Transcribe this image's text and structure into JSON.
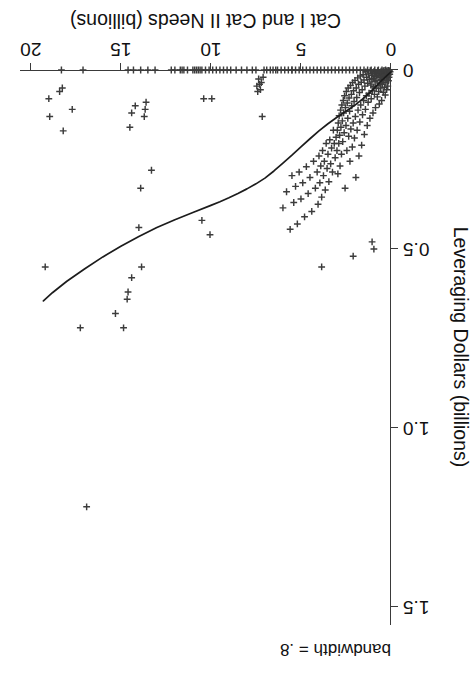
{
  "chart_data": {
    "type": "scatter",
    "title": "",
    "xlabel": "Cat I and Cat II Needs (billions)",
    "ylabel": "Leveraging Dollars (billions)",
    "xlim": [
      0,
      20.6
    ],
    "ylim": [
      0,
      1.55
    ],
    "xticks": [
      0,
      5,
      10,
      15,
      20
    ],
    "xticklabels": [
      "0",
      "5",
      "10",
      "15",
      "20"
    ],
    "yticks": [
      0,
      0.5,
      1.0,
      1.5
    ],
    "yticklabels": [
      "0",
      "0.5",
      "1.0",
      "1.5"
    ],
    "grid": false,
    "legend": false,
    "annotation": "bandwidth = .8",
    "marker_style": "plus",
    "marker_color": "#3c3c3c",
    "line_color": "#1c1c1c",
    "series": [
      {
        "name": "observations",
        "marker": "plus",
        "points": [
          [
            0.05,
            0.005
          ],
          [
            0.07,
            0.012
          ],
          [
            0.09,
            0.002
          ],
          [
            0.11,
            0.02
          ],
          [
            0.12,
            0.008
          ],
          [
            0.14,
            0.03
          ],
          [
            0.15,
            0.001
          ],
          [
            0.16,
            0.015
          ],
          [
            0.18,
            0.045
          ],
          [
            0.19,
            0.006
          ],
          [
            0.21,
            0.025
          ],
          [
            0.22,
            0.002
          ],
          [
            0.24,
            0.055
          ],
          [
            0.25,
            0.018
          ],
          [
            0.27,
            0.004
          ],
          [
            0.28,
            0.035
          ],
          [
            0.3,
            0.011
          ],
          [
            0.32,
            0.07
          ],
          [
            0.33,
            0.001
          ],
          [
            0.35,
            0.022
          ],
          [
            0.36,
            0.048
          ],
          [
            0.38,
            0.009
          ],
          [
            0.4,
            0.03
          ],
          [
            0.41,
            0.002
          ],
          [
            0.43,
            0.062
          ],
          [
            0.45,
            0.017
          ],
          [
            0.47,
            0.005
          ],
          [
            0.48,
            0.04
          ],
          [
            0.5,
            0.013
          ],
          [
            0.52,
            0.085
          ],
          [
            0.54,
            0.027
          ],
          [
            0.55,
            0.003
          ],
          [
            0.57,
            0.05
          ],
          [
            0.59,
            0.016
          ],
          [
            0.61,
            0.038
          ],
          [
            0.63,
            0.007
          ],
          [
            0.65,
            0.095
          ],
          [
            0.66,
            0.021
          ],
          [
            0.68,
            0.06
          ],
          [
            0.7,
            0.011
          ],
          [
            0.72,
            0.043
          ],
          [
            0.74,
            0.002
          ],
          [
            0.76,
            0.075
          ],
          [
            0.78,
            0.029
          ],
          [
            0.8,
            0.014
          ],
          [
            0.82,
            0.052
          ],
          [
            0.84,
            0.008
          ],
          [
            0.86,
            0.105
          ],
          [
            0.88,
            0.033
          ],
          [
            0.9,
            0.019
          ],
          [
            0.92,
            0.068
          ],
          [
            0.94,
            0.004
          ],
          [
            0.96,
            0.047
          ],
          [
            0.98,
            0.024
          ],
          [
            1.0,
            0.12
          ],
          [
            1.02,
            0.009
          ],
          [
            1.04,
            0.058
          ],
          [
            1.06,
            0.031
          ],
          [
            1.08,
            0.015
          ],
          [
            1.1,
            0.08
          ],
          [
            1.12,
            0.042
          ],
          [
            1.15,
            0.002
          ],
          [
            1.17,
            0.135
          ],
          [
            1.2,
            0.026
          ],
          [
            1.22,
            0.065
          ],
          [
            1.25,
            0.011
          ],
          [
            1.27,
            0.09
          ],
          [
            1.3,
            0.037
          ],
          [
            1.32,
            0.155
          ],
          [
            1.35,
            0.02
          ],
          [
            1.37,
            0.072
          ],
          [
            1.4,
            0.005
          ],
          [
            1.42,
            0.11
          ],
          [
            1.45,
            0.045
          ],
          [
            1.48,
            0.18
          ],
          [
            1.5,
            0.028
          ],
          [
            1.52,
            0.085
          ],
          [
            1.55,
            0.013
          ],
          [
            1.58,
            0.125
          ],
          [
            1.6,
            0.055
          ],
          [
            1.63,
            0.21
          ],
          [
            1.65,
            0.034
          ],
          [
            1.68,
            0.098
          ],
          [
            1.7,
            0.017
          ],
          [
            1.73,
            0.145
          ],
          [
            1.75,
            0.063
          ],
          [
            1.78,
            0.24
          ],
          [
            1.8,
            0.04
          ],
          [
            1.83,
            0.112
          ],
          [
            1.85,
            0.022
          ],
          [
            1.88,
            0.168
          ],
          [
            1.9,
            0.077
          ],
          [
            1.93,
            0.05
          ],
          [
            1.95,
            0.3
          ],
          [
            1.98,
            0.13
          ],
          [
            2.0,
            0.029
          ],
          [
            2.03,
            0.19
          ],
          [
            2.05,
            0.088
          ],
          [
            2.08,
            0.058
          ],
          [
            2.1,
            0.148
          ],
          [
            2.13,
            0.035
          ],
          [
            2.15,
            0.215
          ],
          [
            2.18,
            0.1
          ],
          [
            2.2,
            0.068
          ],
          [
            2.23,
            0.165
          ],
          [
            2.25,
            0.043
          ],
          [
            2.28,
            0.255
          ],
          [
            2.3,
            0.115
          ],
          [
            2.33,
            0.078
          ],
          [
            2.35,
            0.185
          ],
          [
            2.38,
            0.05
          ],
          [
            2.4,
            0.135
          ],
          [
            2.43,
            0.092
          ],
          [
            2.45,
            0.225
          ],
          [
            2.48,
            0.06
          ],
          [
            2.5,
            0.155
          ],
          [
            2.53,
            0.105
          ],
          [
            2.55,
            0.33
          ],
          [
            2.58,
            0.072
          ],
          [
            2.6,
            0.175
          ],
          [
            2.63,
            0.12
          ],
          [
            2.65,
            0.085
          ],
          [
            2.68,
            0.2
          ],
          [
            2.7,
            0.142
          ],
          [
            2.73,
            0.098
          ],
          [
            2.75,
            0.235
          ],
          [
            2.78,
            0.16
          ],
          [
            2.8,
            0.112
          ],
          [
            2.83,
            0.268
          ],
          [
            2.85,
            0.182
          ],
          [
            2.88,
            0.128
          ],
          [
            2.9,
            0.205
          ],
          [
            2.93,
            0.148
          ],
          [
            2.95,
            0.29
          ],
          [
            2.98,
            0.168
          ],
          [
            3.0,
            0.225
          ],
          [
            3.05,
            0.188
          ],
          [
            3.1,
            0.245
          ],
          [
            3.15,
            0.205
          ],
          [
            3.2,
            0.168
          ],
          [
            3.25,
            0.285
          ],
          [
            3.3,
            0.218
          ],
          [
            3.35,
            0.262
          ],
          [
            3.4,
            0.195
          ],
          [
            3.45,
            0.312
          ],
          [
            3.5,
            0.235
          ],
          [
            3.55,
            0.275
          ],
          [
            3.6,
            0.205
          ],
          [
            3.65,
            0.335
          ],
          [
            3.7,
            0.255
          ],
          [
            3.75,
            0.295
          ],
          [
            3.8,
            0.225
          ],
          [
            3.85,
            0.355
          ],
          [
            3.9,
            0.268
          ],
          [
            3.95,
            0.315
          ],
          [
            4.0,
            0.24
          ],
          [
            4.05,
            0.375
          ],
          [
            4.1,
            0.285
          ],
          [
            4.2,
            0.33
          ],
          [
            4.3,
            0.255
          ],
          [
            4.4,
            0.395
          ],
          [
            4.5,
            0.3
          ],
          [
            4.6,
            0.345
          ],
          [
            4.7,
            0.27
          ],
          [
            4.8,
            0.41
          ],
          [
            4.9,
            0.315
          ],
          [
            5.0,
            0.36
          ],
          [
            5.1,
            0.285
          ],
          [
            5.2,
            0.43
          ],
          [
            5.3,
            0.325
          ],
          [
            5.4,
            0.37
          ],
          [
            5.5,
            0.295
          ],
          [
            5.6,
            0.445
          ],
          [
            5.8,
            0.34
          ],
          [
            6.0,
            0.385
          ],
          [
            0.3,
            0.0
          ],
          [
            0.5,
            0.0
          ],
          [
            0.7,
            0.0
          ],
          [
            0.9,
            0.0
          ],
          [
            1.1,
            0.0
          ],
          [
            1.3,
            0.0
          ],
          [
            1.5,
            0.0
          ],
          [
            1.7,
            0.0
          ],
          [
            1.9,
            0.0
          ],
          [
            2.1,
            0.0
          ],
          [
            2.3,
            0.0
          ],
          [
            2.5,
            0.0
          ],
          [
            2.7,
            0.0
          ],
          [
            2.9,
            0.0
          ],
          [
            3.1,
            0.0
          ],
          [
            3.3,
            0.0
          ],
          [
            3.5,
            0.0
          ],
          [
            3.7,
            0.0
          ],
          [
            3.9,
            0.0
          ],
          [
            4.1,
            0.0
          ],
          [
            4.3,
            0.0
          ],
          [
            4.5,
            0.0
          ],
          [
            4.7,
            0.0
          ],
          [
            4.9,
            0.0
          ],
          [
            5.1,
            0.0
          ],
          [
            5.3,
            0.0
          ],
          [
            5.5,
            0.0
          ],
          [
            5.7,
            0.0
          ],
          [
            5.9,
            0.0
          ],
          [
            6.1,
            0.0
          ],
          [
            6.4,
            0.0
          ],
          [
            6.7,
            0.0
          ],
          [
            6.9,
            0.0
          ],
          [
            7.1,
            0.02
          ],
          [
            7.2,
            0.035
          ],
          [
            7.25,
            0.055
          ],
          [
            7.3,
            0.04
          ],
          [
            7.35,
            0.025
          ],
          [
            7.4,
            0.06
          ],
          [
            7.45,
            0.045
          ],
          [
            7.15,
            0.13
          ],
          [
            7.5,
            0.0
          ],
          [
            7.7,
            0.0
          ],
          [
            8.0,
            0.0
          ],
          [
            8.3,
            0.0
          ],
          [
            8.6,
            0.0
          ],
          [
            8.9,
            0.0
          ],
          [
            9.1,
            0.0
          ],
          [
            9.3,
            0.0
          ],
          [
            9.5,
            0.0
          ],
          [
            9.7,
            0.0
          ],
          [
            9.9,
            0.0
          ],
          [
            10.1,
            0.0
          ],
          [
            10.3,
            0.0
          ],
          [
            10.5,
            0.0
          ],
          [
            10.6,
            0.0
          ],
          [
            10.7,
            0.0
          ],
          [
            10.8,
            0.0
          ],
          [
            10.9,
            0.0
          ],
          [
            11.0,
            0.0
          ],
          [
            11.3,
            0.0
          ],
          [
            11.5,
            0.0
          ],
          [
            11.6,
            0.0
          ],
          [
            11.7,
            0.0
          ],
          [
            9.95,
            0.08
          ],
          [
            10.4,
            0.08
          ],
          [
            10.5,
            0.42
          ],
          [
            10.05,
            0.46
          ],
          [
            13.1,
            0.0
          ],
          [
            13.5,
            0.0
          ],
          [
            13.9,
            0.0
          ],
          [
            14.3,
            0.0
          ],
          [
            14.6,
            0.0
          ],
          [
            13.6,
            0.09
          ],
          [
            13.65,
            0.11
          ],
          [
            13.7,
            0.13
          ],
          [
            14.2,
            0.1
          ],
          [
            14.4,
            0.12
          ],
          [
            14.5,
            0.16
          ],
          [
            13.3,
            0.28
          ],
          [
            13.9,
            0.33
          ],
          [
            14.0,
            0.44
          ],
          [
            13.85,
            0.55
          ],
          [
            14.4,
            0.58
          ],
          [
            14.6,
            0.62
          ],
          [
            14.65,
            0.64
          ],
          [
            14.85,
            0.72
          ],
          [
            15.3,
            0.68
          ],
          [
            17.1,
            0.0
          ],
          [
            18.3,
            0.0
          ],
          [
            18.25,
            0.05
          ],
          [
            18.4,
            0.06
          ],
          [
            17.7,
            0.11
          ],
          [
            18.2,
            0.17
          ],
          [
            19.0,
            0.08
          ],
          [
            18.95,
            0.13
          ],
          [
            19.2,
            0.55
          ],
          [
            17.25,
            0.72
          ],
          [
            16.9,
            1.22
          ],
          [
            12.0,
            0.0
          ],
          [
            12.2,
            0.0
          ],
          [
            6.55,
            0.0
          ],
          [
            3.85,
            0.55
          ],
          [
            2.1,
            0.52
          ],
          [
            1.05,
            0.48
          ],
          [
            0.95,
            0.5
          ],
          [
            5.5,
            0.0
          ],
          [
            6.3,
            0.0
          ],
          [
            7.05,
            0.0
          ]
        ]
      }
    ],
    "fit_line": {
      "name": "lowess",
      "bandwidth": 0.8,
      "points": [
        [
          0.0,
          0.005
        ],
        [
          0.5,
          0.028
        ],
        [
          1.0,
          0.055
        ],
        [
          1.5,
          0.078
        ],
        [
          2.0,
          0.098
        ],
        [
          2.5,
          0.115
        ],
        [
          3.0,
          0.132
        ],
        [
          3.5,
          0.15
        ],
        [
          4.0,
          0.17
        ],
        [
          4.5,
          0.192
        ],
        [
          5.0,
          0.215
        ],
        [
          5.5,
          0.238
        ],
        [
          6.0,
          0.26
        ],
        [
          6.5,
          0.282
        ],
        [
          7.0,
          0.302
        ],
        [
          7.5,
          0.318
        ],
        [
          8.0,
          0.332
        ],
        [
          8.5,
          0.345
        ],
        [
          9.0,
          0.357
        ],
        [
          9.5,
          0.368
        ],
        [
          10.0,
          0.378
        ],
        [
          11.0,
          0.398
        ],
        [
          12.0,
          0.418
        ],
        [
          13.0,
          0.44
        ],
        [
          14.0,
          0.465
        ],
        [
          15.0,
          0.492
        ],
        [
          16.0,
          0.522
        ],
        [
          17.0,
          0.555
        ],
        [
          18.0,
          0.59
        ],
        [
          18.8,
          0.622
        ],
        [
          19.3,
          0.645
        ]
      ]
    }
  },
  "axes": {
    "x": {
      "label": "Cat I and Cat II Needs (billions)",
      "ticklabels": [
        "0",
        "5",
        "10",
        "15",
        "20"
      ]
    },
    "y": {
      "label": "Leveraging Dollars (billions)",
      "ticklabels": [
        "0",
        "0.5",
        "1.0",
        "1.5"
      ]
    }
  },
  "annotations": {
    "bandwidth": "bandwidth = .8"
  }
}
